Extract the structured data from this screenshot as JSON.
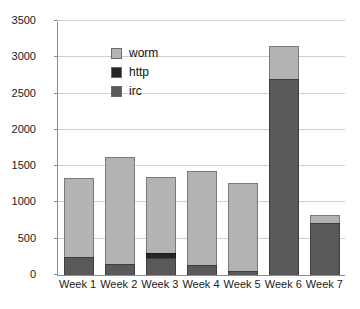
{
  "chart_data": {
    "type": "bar",
    "stacked": true,
    "title": "",
    "xlabel": "",
    "ylabel": "",
    "ylim": [
      0,
      3500
    ],
    "ytick_step": 500,
    "grid": true,
    "legend_position": "top-left-inside",
    "categories": [
      "Week 1",
      "Week 2",
      "Week 3",
      "Week 4",
      "Week 5",
      "Week 6",
      "Week 7"
    ],
    "yticks": [
      "0",
      "500",
      "1000",
      "1500",
      "2000",
      "2500",
      "3000",
      "3500"
    ],
    "series": [
      {
        "name": "irc",
        "color": "#595959",
        "values": [
          250,
          150,
          230,
          140,
          60,
          2700,
          720
        ]
      },
      {
        "name": "http",
        "color": "#262626",
        "values": [
          0,
          0,
          70,
          0,
          0,
          0,
          0
        ]
      },
      {
        "name": "worm",
        "color": "#b3b3b3",
        "values": [
          1080,
          1480,
          1050,
          1300,
          1210,
          450,
          110
        ]
      }
    ],
    "totals": [
      1330,
      1630,
      1350,
      1440,
      1270,
      3150,
      830
    ],
    "legend": [
      {
        "label": "worm",
        "color": "#b3b3b3"
      },
      {
        "label": "http",
        "color": "#262626"
      },
      {
        "label": "irc",
        "color": "#595959"
      }
    ],
    "colors": {
      "grid": "#d0d0d0",
      "axis": "#8c8c8c",
      "text": "#1a1a1a",
      "background": "#ffffff"
    }
  }
}
